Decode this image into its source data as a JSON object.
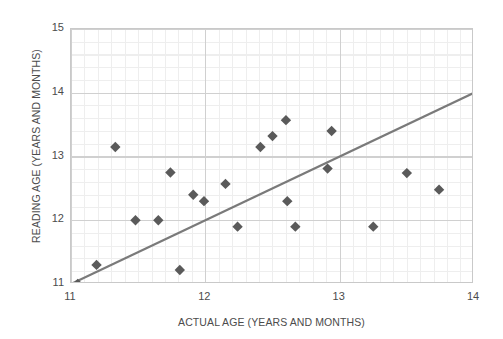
{
  "chart_data": {
    "type": "scatter",
    "title": "",
    "xlabel": "ACTUAL AGE (YEARS AND MONTHS)",
    "ylabel": "READING AGE (YEARS AND MONTHS)",
    "xlim": [
      11,
      14
    ],
    "ylim": [
      11,
      15
    ],
    "xticks": [
      "11",
      "12",
      "13",
      "14"
    ],
    "yticks": [
      "11",
      "12",
      "13",
      "14",
      "15"
    ],
    "xtick_values": [
      11,
      12,
      13,
      14
    ],
    "ytick_values": [
      11,
      12,
      13,
      14,
      15
    ],
    "grid": true,
    "minor_grid": true,
    "legend": "none",
    "marker": "diamond",
    "marker_color": "#5a5a5a",
    "trendline": {
      "label": "line of best fit",
      "color": "#7a7a7a",
      "x": [
        11.0,
        14.0
      ],
      "y": [
        11.0,
        14.0
      ]
    },
    "points": [
      {
        "x": 11.05,
        "y": 11.0
      },
      {
        "x": 11.19,
        "y": 11.3
      },
      {
        "x": 11.33,
        "y": 13.15
      },
      {
        "x": 11.48,
        "y": 12.0
      },
      {
        "x": 11.65,
        "y": 12.0
      },
      {
        "x": 11.74,
        "y": 12.75
      },
      {
        "x": 11.81,
        "y": 11.22
      },
      {
        "x": 11.91,
        "y": 12.4
      },
      {
        "x": 11.99,
        "y": 12.3
      },
      {
        "x": 12.15,
        "y": 12.57
      },
      {
        "x": 12.24,
        "y": 11.9
      },
      {
        "x": 12.41,
        "y": 13.15
      },
      {
        "x": 12.5,
        "y": 13.32
      },
      {
        "x": 12.6,
        "y": 13.57
      },
      {
        "x": 12.61,
        "y": 12.3
      },
      {
        "x": 12.67,
        "y": 11.9
      },
      {
        "x": 12.91,
        "y": 12.81
      },
      {
        "x": 12.94,
        "y": 13.4
      },
      {
        "x": 13.25,
        "y": 11.9
      },
      {
        "x": 13.5,
        "y": 12.74
      },
      {
        "x": 13.74,
        "y": 12.48
      }
    ]
  },
  "axes": {
    "y_title": "READING AGE (YEARS AND MONTHS)",
    "x_title": "ACTUAL AGE (YEARS AND MONTHS)"
  }
}
